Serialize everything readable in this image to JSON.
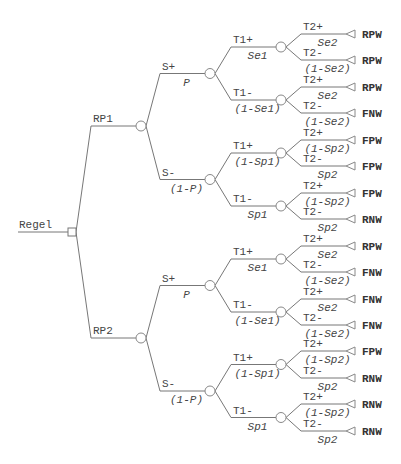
{
  "diagram": {
    "type": "decision-tree",
    "root": {
      "label": "Regel",
      "node_type": "decision",
      "children": [
        {
          "label": "RP1",
          "children": [
            {
              "label": "S+",
              "prob": "P",
              "children": [
                {
                  "label": "T1+",
                  "prob": "Se1",
                  "children": [
                    {
                      "label": "T2+",
                      "prob": "Se2",
                      "outcome": "RPW"
                    },
                    {
                      "label": "T2-",
                      "prob": "(1-Se2)",
                      "outcome": "RPW"
                    }
                  ]
                },
                {
                  "label": "T1-",
                  "prob": "(1-Se1)",
                  "children": [
                    {
                      "label": "T2+",
                      "prob": "Se2",
                      "outcome": "RPW"
                    },
                    {
                      "label": "T2-",
                      "prob": "(1-Se2)",
                      "outcome": "FNW"
                    }
                  ]
                }
              ]
            },
            {
              "label": "S-",
              "prob": "(1-P)",
              "children": [
                {
                  "label": "T1+",
                  "prob": "(1-Sp1)",
                  "children": [
                    {
                      "label": "T2+",
                      "prob": "(1-Sp2)",
                      "outcome": "FPW"
                    },
                    {
                      "label": "T2-",
                      "prob": "Sp2",
                      "outcome": "FPW"
                    }
                  ]
                },
                {
                  "label": "T1-",
                  "prob": "Sp1",
                  "children": [
                    {
                      "label": "T2+",
                      "prob": "(1-Sp2)",
                      "outcome": "FPW"
                    },
                    {
                      "label": "T2-",
                      "prob": "Sp2",
                      "outcome": "RNW"
                    }
                  ]
                }
              ]
            }
          ]
        },
        {
          "label": "RP2",
          "children": [
            {
              "label": "S+",
              "prob": "P",
              "children": [
                {
                  "label": "T1+",
                  "prob": "Se1",
                  "children": [
                    {
                      "label": "T2+",
                      "prob": "Se2",
                      "outcome": "RPW"
                    },
                    {
                      "label": "T2-",
                      "prob": "(1-Se2)",
                      "outcome": "FNW"
                    }
                  ]
                },
                {
                  "label": "T1-",
                  "prob": "(1-Se1)",
                  "children": [
                    {
                      "label": "T2+",
                      "prob": "Se2",
                      "outcome": "FNW"
                    },
                    {
                      "label": "T2-",
                      "prob": "(1-Se2)",
                      "outcome": "FNW"
                    }
                  ]
                }
              ]
            },
            {
              "label": "S-",
              "prob": "(1-P)",
              "children": [
                {
                  "label": "T1+",
                  "prob": "(1-Sp1)",
                  "children": [
                    {
                      "label": "T2+",
                      "prob": "(1-Sp2)",
                      "outcome": "FPW"
                    },
                    {
                      "label": "T2-",
                      "prob": "Sp2",
                      "outcome": "RNW"
                    }
                  ]
                },
                {
                  "label": "T1-",
                  "prob": "Sp1",
                  "children": [
                    {
                      "label": "T2+",
                      "prob": "(1-Sp2)",
                      "outcome": "RNW"
                    },
                    {
                      "label": "T2-",
                      "prob": "Sp2",
                      "outcome": "RNW"
                    }
                  ]
                }
              ]
            }
          ]
        }
      ]
    }
  },
  "colors": {
    "edge": "#777777",
    "node_stroke": "#888888",
    "text": "#444444",
    "outcome_text": "#333333",
    "background": "#ffffff"
  }
}
